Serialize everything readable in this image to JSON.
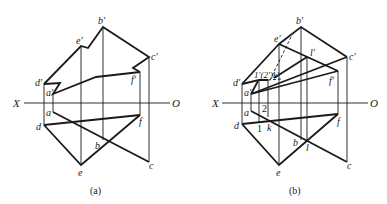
{
  "figure": {
    "panels": [
      {
        "caption": "(a)",
        "axis": {
          "left_label": "X",
          "right_label": "O"
        },
        "labels": {
          "b_prime": "b′",
          "e_prime": "e′",
          "c_prime": "c′",
          "d_prime": "d′",
          "a_prime": "a′",
          "f_prime": "f′",
          "a": "a",
          "d": "d",
          "f": "f",
          "b": "b",
          "e": "e",
          "c": "c"
        }
      },
      {
        "caption": "(b)",
        "axis": {
          "left_label": "X",
          "right_label": "O"
        },
        "labels": {
          "b_prime": "b′",
          "e_prime": "e′",
          "c_prime": "c′",
          "d_prime": "d′",
          "a_prime": "a′",
          "f_prime": "f′",
          "l_prime": "l′",
          "one_two_k_prime": "1′(2′)k′",
          "a": "a",
          "d": "d",
          "f": "f",
          "b": "b",
          "e": "e",
          "c": "c",
          "two": "2",
          "one": "1",
          "k": "k",
          "l": "l"
        }
      }
    ]
  }
}
